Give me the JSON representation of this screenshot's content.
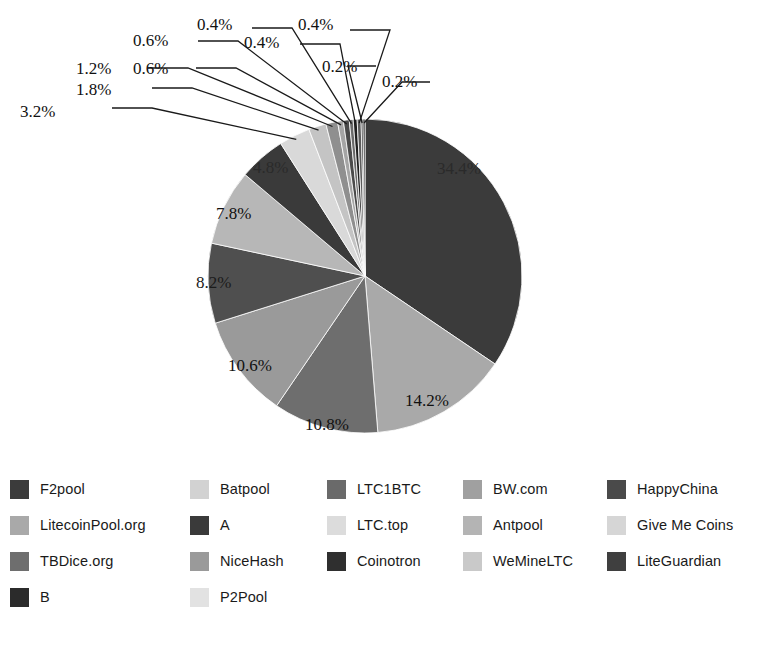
{
  "chart_data": {
    "type": "pie",
    "title": "",
    "subtitle": "",
    "xlabel": "",
    "ylabel": "",
    "unit": "%",
    "legend_position": "bottom",
    "grid": false,
    "start_angle_deg": 0,
    "direction": "clockwise",
    "categories": [
      "F2pool",
      "LitecoinPool.org",
      "TBDice.org",
      "B",
      "Batpool",
      "A",
      "NiceHash",
      "P2Pool",
      "LTC1BTC",
      "LTC.top",
      "Coinotron",
      "BW.com",
      "Antpool",
      "WeMineLTC",
      "HappyChina",
      "Give Me Coins",
      "LiteGuardian"
    ],
    "values": [
      34.4,
      14.2,
      10.8,
      10.6,
      8.2,
      7.8,
      4.8,
      3.2,
      1.8,
      1.2,
      0.6,
      0.6,
      0.4,
      0.4,
      0.4,
      0.2,
      0.2
    ],
    "slice_colors": [
      "#3b3b3b",
      "#a9a9a9",
      "#6e6e6e",
      "#9a9a9a",
      "#4f4f4f",
      "#b7b7b7",
      "#8a8a8a",
      "#d9d9d9",
      "#bdbdbd",
      "#777777",
      "#9e9e9e",
      "#3f3f3f",
      "#6a6a6a",
      "#1f1f1f",
      "#5c5c5c",
      "#2b2b2b",
      "#141414"
    ],
    "slices": [
      {
        "label": "F2pool",
        "value": 34.4,
        "display": "34.4%",
        "color": "#3b3b3b",
        "label_style": "inner"
      },
      {
        "label": "LitecoinPool.org",
        "value": 14.2,
        "display": "14.2%",
        "color": "#a9a9a9",
        "label_style": "inner"
      },
      {
        "label": "TBDice.org",
        "value": 10.8,
        "display": "10.8%",
        "color": "#6e6e6e",
        "label_style": "inner"
      },
      {
        "label": "B",
        "value": 10.6,
        "display": "10.6%",
        "color": "#9a9a9a",
        "label_style": "inner"
      },
      {
        "label": "Batpool",
        "value": 8.2,
        "display": "8.2%",
        "color": "#4f4f4f",
        "label_style": "inner"
      },
      {
        "label": "A",
        "value": 7.8,
        "display": "7.8%",
        "color": "#b7b7b7",
        "label_style": "inner"
      },
      {
        "label": "NiceHash",
        "value": 4.8,
        "display": "4.8%",
        "color": "#3a3a3a",
        "label_style": "inner"
      },
      {
        "label": "P2Pool",
        "value": 3.2,
        "display": "3.2%",
        "color": "#d9d9d9",
        "label_style": "leader"
      },
      {
        "label": "LTC1BTC",
        "value": 1.8,
        "display": "1.8%",
        "color": "#c4c4c4",
        "label_style": "leader"
      },
      {
        "label": "LTC.top",
        "value": 1.2,
        "display": "1.2%",
        "color": "#8f8f8f",
        "label_style": "leader"
      },
      {
        "label": "Coinotron",
        "value": 0.6,
        "display": "0.6%",
        "color": "#a5a5a5",
        "label_style": "leader"
      },
      {
        "label": "BW.com",
        "value": 0.6,
        "display": "0.6%",
        "color": "#4a4a4a",
        "label_style": "leader"
      },
      {
        "label": "Antpool",
        "value": 0.4,
        "display": "0.4%",
        "color": "#6a6a6a",
        "label_style": "leader"
      },
      {
        "label": "WeMineLTC",
        "value": 0.4,
        "display": "0.4%",
        "color": "#1f1f1f",
        "label_style": "leader"
      },
      {
        "label": "HappyChina",
        "value": 0.4,
        "display": "0.4%",
        "color": "#5c5c5c",
        "label_style": "leader"
      },
      {
        "label": "Give Me Coins",
        "value": 0.2,
        "display": "0.2%",
        "color": "#2b2b2b",
        "label_style": "leader"
      },
      {
        "label": "LiteGuardian",
        "value": 0.2,
        "display": "0.2%",
        "color": "#141414",
        "label_style": "leader"
      }
    ],
    "data_labels": [
      "34.4%",
      "14.2%",
      "10.8%",
      "10.6%",
      "8.2%",
      "7.8%",
      "4.8%",
      "3.2%",
      "1.8%",
      "1.2%",
      "0.6%",
      "0.6%",
      "0.4%",
      "0.4%",
      "0.4%",
      "0.2%",
      "0.2%"
    ]
  },
  "pie": {
    "center_x": 365,
    "center_y": 276,
    "radius": 157,
    "inner_labels": [
      {
        "text": "34.4%",
        "x": 437,
        "y": 160
      },
      {
        "text": "14.2%",
        "x": 405,
        "y": 392
      },
      {
        "text": "10.8%",
        "x": 305,
        "y": 416
      },
      {
        "text": "10.6%",
        "x": 228,
        "y": 357
      },
      {
        "text": "8.2%",
        "x": 196,
        "y": 274
      },
      {
        "text": "7.8%",
        "x": 216,
        "y": 205
      },
      {
        "text": "4.8%",
        "x": 253,
        "y": 159
      }
    ],
    "leader_labels": [
      {
        "text": "3.2%",
        "x": 20,
        "y": 103
      },
      {
        "text": "1.8%",
        "x": 76,
        "y": 81
      },
      {
        "text": "1.2%",
        "x": 76,
        "y": 60
      },
      {
        "text": "0.6%",
        "x": 133,
        "y": 60
      },
      {
        "text": "0.6%",
        "x": 133,
        "y": 32
      },
      {
        "text": "0.4%",
        "x": 197,
        "y": 16
      },
      {
        "text": "0.4%",
        "x": 244,
        "y": 34
      },
      {
        "text": "0.4%",
        "x": 298,
        "y": 16
      },
      {
        "text": "0.2%",
        "x": 322,
        "y": 58
      },
      {
        "text": "0.2%",
        "x": 382,
        "y": 73
      }
    ]
  },
  "legend": {
    "columns": 5,
    "rows": 4,
    "items": [
      {
        "label": "F2pool",
        "color": "#3b3b3b",
        "col": 0,
        "row": 0
      },
      {
        "label": "LitecoinPool.org",
        "color": "#a9a9a9",
        "col": 0,
        "row": 1
      },
      {
        "label": "TBDice.org",
        "color": "#6e6e6e",
        "col": 0,
        "row": 2
      },
      {
        "label": "B",
        "color": "#2b2b2b",
        "col": 0,
        "row": 3
      },
      {
        "label": "Batpool",
        "color": "#d2d2d2",
        "col": 1,
        "row": 0
      },
      {
        "label": "A",
        "color": "#3a3a3a",
        "col": 1,
        "row": 1
      },
      {
        "label": "NiceHash",
        "color": "#9a9a9a",
        "col": 1,
        "row": 2
      },
      {
        "label": "P2Pool",
        "color": "#e2e2e2",
        "col": 1,
        "row": 3
      },
      {
        "label": "LTC1BTC",
        "color": "#6a6a6a",
        "col": 2,
        "row": 0
      },
      {
        "label": "LTC.top",
        "color": "#dcdcdc",
        "col": 2,
        "row": 1
      },
      {
        "label": "Coinotron",
        "color": "#2f2f2f",
        "col": 2,
        "row": 2
      },
      {
        "label": "BW.com",
        "color": "#a0a0a0",
        "col": 3,
        "row": 0
      },
      {
        "label": "Antpool",
        "color": "#b4b4b4",
        "col": 3,
        "row": 1
      },
      {
        "label": "WeMineLTC",
        "color": "#c9c9c9",
        "col": 3,
        "row": 2
      },
      {
        "label": "HappyChina",
        "color": "#4a4a4a",
        "col": 4,
        "row": 0
      },
      {
        "label": "Give Me Coins",
        "color": "#d6d6d6",
        "col": 4,
        "row": 1
      },
      {
        "label": "LiteGuardian",
        "color": "#3f3f3f",
        "col": 4,
        "row": 2
      }
    ]
  },
  "colors": {
    "background": "#ffffff",
    "text": "#111111",
    "leader_line": "#1a1a1a"
  }
}
